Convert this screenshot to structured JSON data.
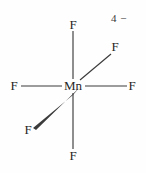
{
  "figure": {
    "kind": "chemical-structure-diagram",
    "name": "hexafluoromanganate ion",
    "background_color": "#fefefe",
    "line_color": "#3b3b3b",
    "text_color": "#262626",
    "charge": {
      "value": "4",
      "sign": "−",
      "full": "4 −"
    },
    "center_atom": {
      "label": "Mn",
      "x": 73,
      "y": 86
    },
    "ligands": [
      {
        "id": "f-top",
        "label": "F",
        "x": 73,
        "y": 25,
        "bond": "plain"
      },
      {
        "id": "f-bottom",
        "label": "F",
        "x": 73,
        "y": 156,
        "bond": "plain"
      },
      {
        "id": "f-left",
        "label": "F",
        "x": 14,
        "y": 86,
        "bond": "plain"
      },
      {
        "id": "f-right",
        "label": "F",
        "x": 132,
        "y": 86,
        "bond": "plain"
      },
      {
        "id": "f-upper-right",
        "label": "F",
        "x": 115,
        "y": 47,
        "bond": "plain"
      },
      {
        "id": "f-lower-left",
        "label": "F",
        "x": 28,
        "y": 130,
        "bond": "wedge"
      }
    ]
  }
}
